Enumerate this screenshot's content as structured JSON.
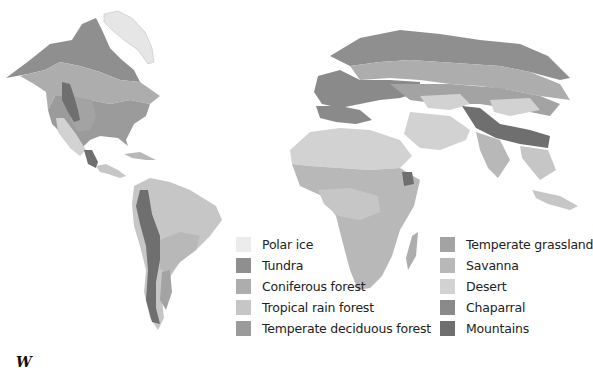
{
  "map": {
    "title": "World biomes map",
    "colors": {
      "polar_ice": "#ececec",
      "tundra": "#8f8f8f",
      "coniferous_forest": "#adadad",
      "tropical_rain_forest": "#c6c6c6",
      "temperate_deciduous_forest": "#9b9b9b",
      "temperate_grassland": "#a3a3a3",
      "savanna": "#b8b8b8",
      "desert": "#d2d2d2",
      "chaparral": "#8a8a8a",
      "mountains": "#6f6f6f"
    }
  },
  "legend": {
    "col1": [
      {
        "label": "Polar ice",
        "color": "#ececec"
      },
      {
        "label": "Tundra",
        "color": "#8f8f8f"
      },
      {
        "label": "Coniferous forest",
        "color": "#adadad"
      },
      {
        "label": "Tropical rain forest",
        "color": "#c6c6c6"
      },
      {
        "label": "Temperate deciduous forest",
        "color": "#9b9b9b"
      }
    ],
    "col2": [
      {
        "label": "Temperate grassland",
        "color": "#a3a3a3"
      },
      {
        "label": "Savanna",
        "color": "#b8b8b8"
      },
      {
        "label": "Desert",
        "color": "#d2d2d2"
      },
      {
        "label": "Chaparral",
        "color": "#8a8a8a"
      },
      {
        "label": "Mountains",
        "color": "#6f6f6f"
      }
    ]
  },
  "footer": {
    "cutoff_text": "W"
  }
}
